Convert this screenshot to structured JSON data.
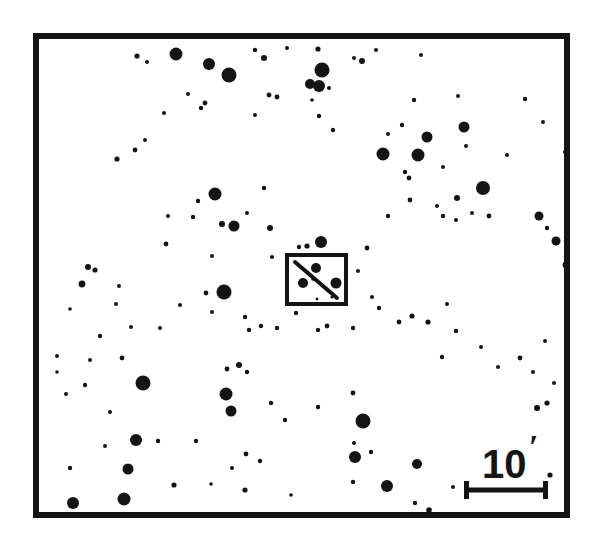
{
  "figure": {
    "kind": "astronomical-finder-chart",
    "width": 592,
    "height": 557,
    "background_color": "#ffffff",
    "ink_color": "#141414"
  },
  "frame": {
    "x": 33,
    "y": 33,
    "width": 537,
    "height": 485,
    "stroke_width": 6
  },
  "scale_bar": {
    "label": "10",
    "unit_symbol": "′",
    "label_full": "10′",
    "meaning": "10 arcminutes",
    "bar_x1": 464,
    "bar_x2": 548,
    "bar_y": 490,
    "bar_stroke_width": 5,
    "cap_half_height": 9,
    "cap_stroke_width": 5,
    "label_x": 482,
    "label_y": 478,
    "prime_x": 529,
    "prime_y": 458
  },
  "target_box": {
    "x": 287,
    "y": 255,
    "width": 59,
    "height": 49,
    "stroke_width": 4,
    "streak": {
      "x1": 295,
      "y1": 262,
      "x2": 337,
      "y2": 298,
      "stroke_width": 4
    },
    "inner_stars": [
      {
        "cx": 303,
        "cy": 283,
        "r": 5.0
      },
      {
        "cx": 316,
        "cy": 268,
        "r": 5.0
      },
      {
        "cx": 336,
        "cy": 283,
        "r": 5.5
      },
      {
        "cx": 313,
        "cy": 279,
        "r": 1.8
      },
      {
        "cx": 332,
        "cy": 297,
        "r": 1.6
      },
      {
        "cx": 317,
        "cy": 299,
        "r": 1.4
      }
    ]
  },
  "chart_data": {
    "type": "scatter",
    "title": "",
    "xlabel": "",
    "ylabel": "",
    "point_count": 148,
    "encoding": "marker radius encodes stellar brightness (larger = brighter)",
    "stars": [
      {
        "cx": 176,
        "cy": 54,
        "r": 6.5
      },
      {
        "cx": 209,
        "cy": 64,
        "r": 6.0
      },
      {
        "cx": 229,
        "cy": 75,
        "r": 7.5
      },
      {
        "cx": 255,
        "cy": 50,
        "r": 2.2
      },
      {
        "cx": 264,
        "cy": 58,
        "r": 3.0
      },
      {
        "cx": 287,
        "cy": 48,
        "r": 2.0
      },
      {
        "cx": 318,
        "cy": 49,
        "r": 2.6
      },
      {
        "cx": 322,
        "cy": 70,
        "r": 7.5
      },
      {
        "cx": 310,
        "cy": 84,
        "r": 5.0
      },
      {
        "cx": 319,
        "cy": 86,
        "r": 6.0
      },
      {
        "cx": 329,
        "cy": 88,
        "r": 2.0
      },
      {
        "cx": 354,
        "cy": 58,
        "r": 2.0
      },
      {
        "cx": 362,
        "cy": 61,
        "r": 3.0
      },
      {
        "cx": 376,
        "cy": 50,
        "r": 2.0
      },
      {
        "cx": 421,
        "cy": 55,
        "r": 2.0
      },
      {
        "cx": 137,
        "cy": 56,
        "r": 2.6
      },
      {
        "cx": 147,
        "cy": 62,
        "r": 2.0
      },
      {
        "cx": 205,
        "cy": 103,
        "r": 2.4
      },
      {
        "cx": 201,
        "cy": 108,
        "r": 2.2
      },
      {
        "cx": 188,
        "cy": 94,
        "r": 2.0
      },
      {
        "cx": 269,
        "cy": 95,
        "r": 2.4
      },
      {
        "cx": 277,
        "cy": 97,
        "r": 2.4
      },
      {
        "cx": 312,
        "cy": 100,
        "r": 1.8
      },
      {
        "cx": 255,
        "cy": 115,
        "r": 2.0
      },
      {
        "cx": 319,
        "cy": 116,
        "r": 2.2
      },
      {
        "cx": 333,
        "cy": 130,
        "r": 2.2
      },
      {
        "cx": 164,
        "cy": 113,
        "r": 2.0
      },
      {
        "cx": 135,
        "cy": 150,
        "r": 2.4
      },
      {
        "cx": 117,
        "cy": 159,
        "r": 2.6
      },
      {
        "cx": 145,
        "cy": 140,
        "r": 2.0
      },
      {
        "cx": 414,
        "cy": 100,
        "r": 2.2
      },
      {
        "cx": 458,
        "cy": 96,
        "r": 2.0
      },
      {
        "cx": 464,
        "cy": 127,
        "r": 5.5
      },
      {
        "cx": 427,
        "cy": 137,
        "r": 5.5
      },
      {
        "cx": 418,
        "cy": 155,
        "r": 6.5
      },
      {
        "cx": 383,
        "cy": 154,
        "r": 6.5
      },
      {
        "cx": 402,
        "cy": 125,
        "r": 2.2
      },
      {
        "cx": 388,
        "cy": 134,
        "r": 2.0
      },
      {
        "cx": 405,
        "cy": 172,
        "r": 2.2
      },
      {
        "cx": 409,
        "cy": 178,
        "r": 2.4
      },
      {
        "cx": 443,
        "cy": 167,
        "r": 2.0
      },
      {
        "cx": 483,
        "cy": 188,
        "r": 7.0
      },
      {
        "cx": 466,
        "cy": 146,
        "r": 2.0
      },
      {
        "cx": 507,
        "cy": 155,
        "r": 2.0
      },
      {
        "cx": 565,
        "cy": 152,
        "r": 2.0
      },
      {
        "cx": 525,
        "cy": 99,
        "r": 2.2
      },
      {
        "cx": 543,
        "cy": 122,
        "r": 2.0
      },
      {
        "cx": 264,
        "cy": 188,
        "r": 2.2
      },
      {
        "cx": 215,
        "cy": 194,
        "r": 6.5
      },
      {
        "cx": 198,
        "cy": 201,
        "r": 2.2
      },
      {
        "cx": 193,
        "cy": 217,
        "r": 2.2
      },
      {
        "cx": 222,
        "cy": 224,
        "r": 3.0
      },
      {
        "cx": 234,
        "cy": 226,
        "r": 5.5
      },
      {
        "cx": 270,
        "cy": 228,
        "r": 3.0
      },
      {
        "cx": 247,
        "cy": 213,
        "r": 2.0
      },
      {
        "cx": 168,
        "cy": 216,
        "r": 2.0
      },
      {
        "cx": 166,
        "cy": 244,
        "r": 2.4
      },
      {
        "cx": 212,
        "cy": 256,
        "r": 2.0
      },
      {
        "cx": 272,
        "cy": 257,
        "r": 2.0
      },
      {
        "cx": 299,
        "cy": 247,
        "r": 2.2
      },
      {
        "cx": 307,
        "cy": 246,
        "r": 2.6
      },
      {
        "cx": 321,
        "cy": 242,
        "r": 6.0
      },
      {
        "cx": 367,
        "cy": 248,
        "r": 2.4
      },
      {
        "cx": 358,
        "cy": 271,
        "r": 2.0
      },
      {
        "cx": 388,
        "cy": 216,
        "r": 2.2
      },
      {
        "cx": 443,
        "cy": 216,
        "r": 2.2
      },
      {
        "cx": 456,
        "cy": 220,
        "r": 2.0
      },
      {
        "cx": 472,
        "cy": 213,
        "r": 2.0
      },
      {
        "cx": 437,
        "cy": 206,
        "r": 2.0
      },
      {
        "cx": 410,
        "cy": 200,
        "r": 2.4
      },
      {
        "cx": 457,
        "cy": 198,
        "r": 3.0
      },
      {
        "cx": 489,
        "cy": 216,
        "r": 2.4
      },
      {
        "cx": 539,
        "cy": 216,
        "r": 4.5
      },
      {
        "cx": 547,
        "cy": 228,
        "r": 2.2
      },
      {
        "cx": 556,
        "cy": 241,
        "r": 4.5
      },
      {
        "cx": 566,
        "cy": 265,
        "r": 3.4
      },
      {
        "cx": 88,
        "cy": 267,
        "r": 3.0
      },
      {
        "cx": 95,
        "cy": 270,
        "r": 2.6
      },
      {
        "cx": 82,
        "cy": 284,
        "r": 3.4
      },
      {
        "cx": 119,
        "cy": 286,
        "r": 2.0
      },
      {
        "cx": 70,
        "cy": 309,
        "r": 1.8
      },
      {
        "cx": 116,
        "cy": 304,
        "r": 2.0
      },
      {
        "cx": 131,
        "cy": 327,
        "r": 2.0
      },
      {
        "cx": 100,
        "cy": 336,
        "r": 2.2
      },
      {
        "cx": 160,
        "cy": 328,
        "r": 2.0
      },
      {
        "cx": 206,
        "cy": 293,
        "r": 2.4
      },
      {
        "cx": 224,
        "cy": 292,
        "r": 7.5
      },
      {
        "cx": 212,
        "cy": 312,
        "r": 2.0
      },
      {
        "cx": 180,
        "cy": 305,
        "r": 2.0
      },
      {
        "cx": 245,
        "cy": 317,
        "r": 2.2
      },
      {
        "cx": 249,
        "cy": 330,
        "r": 2.2
      },
      {
        "cx": 261,
        "cy": 326,
        "r": 2.2
      },
      {
        "cx": 296,
        "cy": 313,
        "r": 2.2
      },
      {
        "cx": 277,
        "cy": 328,
        "r": 2.2
      },
      {
        "cx": 318,
        "cy": 330,
        "r": 2.2
      },
      {
        "cx": 327,
        "cy": 326,
        "r": 2.4
      },
      {
        "cx": 353,
        "cy": 328,
        "r": 2.2
      },
      {
        "cx": 379,
        "cy": 308,
        "r": 2.2
      },
      {
        "cx": 372,
        "cy": 297,
        "r": 2.0
      },
      {
        "cx": 399,
        "cy": 322,
        "r": 2.4
      },
      {
        "cx": 412,
        "cy": 316,
        "r": 2.6
      },
      {
        "cx": 428,
        "cy": 322,
        "r": 2.6
      },
      {
        "cx": 447,
        "cy": 304,
        "r": 2.0
      },
      {
        "cx": 442,
        "cy": 357,
        "r": 2.2
      },
      {
        "cx": 456,
        "cy": 331,
        "r": 2.2
      },
      {
        "cx": 481,
        "cy": 347,
        "r": 2.0
      },
      {
        "cx": 520,
        "cy": 358,
        "r": 2.4
      },
      {
        "cx": 545,
        "cy": 341,
        "r": 2.0
      },
      {
        "cx": 498,
        "cy": 367,
        "r": 2.0
      },
      {
        "cx": 533,
        "cy": 372,
        "r": 2.0
      },
      {
        "cx": 547,
        "cy": 403,
        "r": 2.6
      },
      {
        "cx": 537,
        "cy": 408,
        "r": 3.0
      },
      {
        "cx": 554,
        "cy": 383,
        "r": 2.0
      },
      {
        "cx": 566,
        "cy": 350,
        "r": 2.0
      },
      {
        "cx": 226,
        "cy": 394,
        "r": 6.5
      },
      {
        "cx": 143,
        "cy": 383,
        "r": 7.5
      },
      {
        "cx": 231,
        "cy": 411,
        "r": 5.5
      },
      {
        "cx": 227,
        "cy": 369,
        "r": 2.4
      },
      {
        "cx": 239,
        "cy": 365,
        "r": 3.0
      },
      {
        "cx": 247,
        "cy": 372,
        "r": 2.2
      },
      {
        "cx": 136,
        "cy": 440,
        "r": 6.0
      },
      {
        "cx": 196,
        "cy": 441,
        "r": 2.2
      },
      {
        "cx": 105,
        "cy": 446,
        "r": 2.0
      },
      {
        "cx": 85,
        "cy": 385,
        "r": 2.2
      },
      {
        "cx": 122,
        "cy": 358,
        "r": 2.4
      },
      {
        "cx": 90,
        "cy": 360,
        "r": 2.0
      },
      {
        "cx": 57,
        "cy": 356,
        "r": 2.0
      },
      {
        "cx": 66,
        "cy": 394,
        "r": 2.0
      },
      {
        "cx": 110,
        "cy": 412,
        "r": 2.0
      },
      {
        "cx": 158,
        "cy": 441,
        "r": 2.2
      },
      {
        "cx": 70,
        "cy": 468,
        "r": 2.2
      },
      {
        "cx": 174,
        "cy": 485,
        "r": 2.6
      },
      {
        "cx": 271,
        "cy": 403,
        "r": 2.2
      },
      {
        "cx": 285,
        "cy": 420,
        "r": 2.2
      },
      {
        "cx": 318,
        "cy": 407,
        "r": 2.2
      },
      {
        "cx": 363,
        "cy": 421,
        "r": 7.5
      },
      {
        "cx": 353,
        "cy": 393,
        "r": 2.4
      },
      {
        "cx": 355,
        "cy": 457,
        "r": 6.0
      },
      {
        "cx": 354,
        "cy": 443,
        "r": 2.0
      },
      {
        "cx": 371,
        "cy": 452,
        "r": 2.2
      },
      {
        "cx": 353,
        "cy": 482,
        "r": 2.2
      },
      {
        "cx": 387,
        "cy": 486,
        "r": 6.0
      },
      {
        "cx": 260,
        "cy": 461,
        "r": 2.2
      },
      {
        "cx": 246,
        "cy": 454,
        "r": 2.4
      },
      {
        "cx": 232,
        "cy": 468,
        "r": 2.0
      },
      {
        "cx": 245,
        "cy": 490,
        "r": 2.6
      },
      {
        "cx": 417,
        "cy": 464,
        "r": 5.0
      },
      {
        "cx": 453,
        "cy": 487,
        "r": 2.0
      },
      {
        "cx": 415,
        "cy": 503,
        "r": 2.2
      },
      {
        "cx": 128,
        "cy": 469,
        "r": 5.5
      },
      {
        "cx": 73,
        "cy": 503,
        "r": 6.0
      },
      {
        "cx": 124,
        "cy": 499,
        "r": 6.5
      },
      {
        "cx": 429,
        "cy": 510,
        "r": 2.8
      },
      {
        "cx": 550,
        "cy": 475,
        "r": 2.6
      },
      {
        "cx": 57,
        "cy": 372,
        "r": 1.8
      },
      {
        "cx": 211,
        "cy": 484,
        "r": 1.8
      },
      {
        "cx": 291,
        "cy": 495,
        "r": 1.8
      }
    ]
  }
}
